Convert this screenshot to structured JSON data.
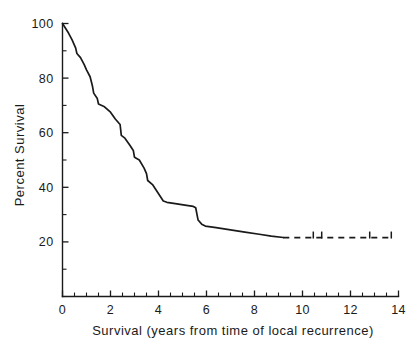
{
  "chart_data": {
    "type": "line",
    "title": "",
    "subtitle": "",
    "xlabel": "Survival (years from time of local recurrence)",
    "ylabel": "Percent Survival",
    "xlim": [
      0,
      14
    ],
    "ylim": [
      0,
      100
    ],
    "x_ticks": [
      0,
      2,
      4,
      6,
      8,
      10,
      12,
      14
    ],
    "x_tick_labels": [
      "0",
      "2",
      "4",
      "6",
      "8",
      "10",
      "12",
      "14"
    ],
    "x_minor_tick_interval": 0.5,
    "y_ticks": [
      20,
      40,
      60,
      80,
      100
    ],
    "y_tick_labels": [
      "20",
      "40",
      "60",
      "80",
      "100"
    ],
    "y_minor_tick_interval": 10,
    "grid": false,
    "legend": null,
    "legend_position": "none",
    "series": [
      {
        "name": "Percent survival after local recurrence",
        "style": "solid",
        "points": [
          [
            0.0,
            100.0
          ],
          [
            0.25,
            96.5
          ],
          [
            0.4,
            94.0
          ],
          [
            0.55,
            91.0
          ],
          [
            0.6,
            89.0
          ],
          [
            0.75,
            87.5
          ],
          [
            0.9,
            85.0
          ],
          [
            1.0,
            83.0
          ],
          [
            1.15,
            80.5
          ],
          [
            1.25,
            77.0
          ],
          [
            1.3,
            74.5
          ],
          [
            1.45,
            72.5
          ],
          [
            1.5,
            70.5
          ],
          [
            1.75,
            69.5
          ],
          [
            2.0,
            67.5
          ],
          [
            2.2,
            65.0
          ],
          [
            2.4,
            63.0
          ],
          [
            2.45,
            59.0
          ],
          [
            2.6,
            58.0
          ],
          [
            2.8,
            55.5
          ],
          [
            2.95,
            53.5
          ],
          [
            3.0,
            51.0
          ],
          [
            3.2,
            50.0
          ],
          [
            3.4,
            47.0
          ],
          [
            3.5,
            45.0
          ],
          [
            3.55,
            42.5
          ],
          [
            3.75,
            41.0
          ],
          [
            3.9,
            39.0
          ],
          [
            4.05,
            37.0
          ],
          [
            4.2,
            35.0
          ],
          [
            4.35,
            34.5
          ],
          [
            4.7,
            34.0
          ],
          [
            5.1,
            33.5
          ],
          [
            5.45,
            33.0
          ],
          [
            5.55,
            32.5
          ],
          [
            5.65,
            28.0
          ],
          [
            5.8,
            26.5
          ],
          [
            5.95,
            25.8
          ],
          [
            6.4,
            25.2
          ],
          [
            7.0,
            24.4
          ],
          [
            7.6,
            23.6
          ],
          [
            8.2,
            22.8
          ],
          [
            8.7,
            22.1
          ],
          [
            9.2,
            21.6
          ]
        ]
      },
      {
        "name": "Extrapolated tail (few patients at risk)",
        "style": "dashed",
        "points": [
          [
            9.2,
            21.6
          ],
          [
            13.75,
            21.6
          ]
        ]
      }
    ],
    "censor_marks": [
      {
        "x": 10.45,
        "y": 21.6
      },
      {
        "x": 10.8,
        "y": 21.6
      },
      {
        "x": 12.8,
        "y": 21.6
      },
      {
        "x": 13.7,
        "y": 21.6
      }
    ]
  }
}
